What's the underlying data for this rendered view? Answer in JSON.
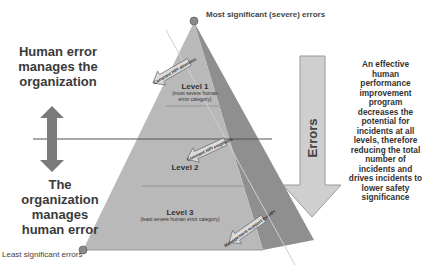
{
  "labels": {
    "top_left": "Human error manages the organization",
    "bottom_left": "The organization manages human error",
    "most_significant": "Most significant (severe) errors",
    "least_significant": "Least significant errors",
    "errors_arrow": "Errors",
    "description": "An effective human performance improvement program decreases the potential for incidents at all levels, therefore reducing the total number of incidents and drives incidents to lower safety significance"
  },
  "pyramid": {
    "levels": [
      {
        "title": "Level 1",
        "subtitle": "(most severe human error category)"
      },
      {
        "title": "Level 2",
        "subtitle": ""
      },
      {
        "title": "Level 3",
        "subtitle": "(least severe human error category)"
      }
    ],
    "arrows": [
      {
        "label": "Constant HPI attention"
      },
      {
        "label": "Constant HPI emphasis"
      },
      {
        "label": "Management support for HPI"
      }
    ]
  },
  "colors": {
    "front_face": "#b8b8b8",
    "side_face": "#8f8f8f",
    "arrow_fill": "#7a7a7a",
    "text": "#3a3a3a"
  }
}
